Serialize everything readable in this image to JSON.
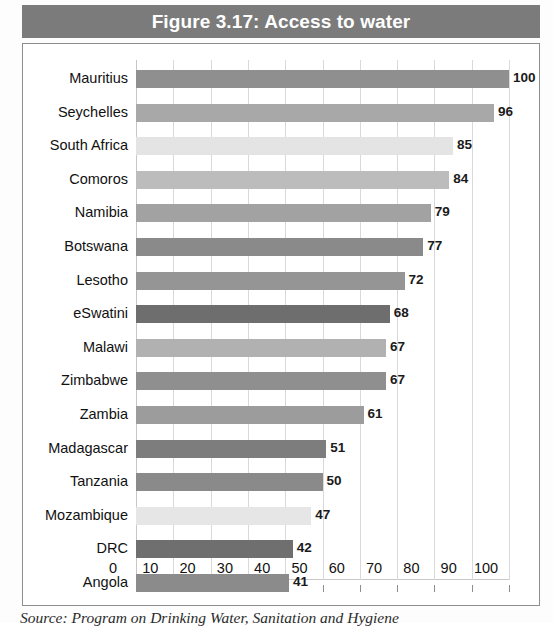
{
  "figure": {
    "title": "Figure 3.17: Access to water",
    "source": "Source: Program on Drinking Water, Sanitation and Hygiene",
    "title_bar_color": "#7b7b7b",
    "frame_color": "#8d8d8d",
    "grid_color": "#d9d9d9"
  },
  "chart_data": {
    "type": "bar",
    "orientation": "horizontal",
    "title": "Figure 3.17: Access to water",
    "xlabel": "",
    "ylabel": "",
    "xlim": [
      0,
      100
    ],
    "grid": true,
    "legend": "none",
    "xticks": [
      0,
      10,
      20,
      30,
      40,
      50,
      60,
      70,
      80,
      90,
      100
    ],
    "categories": [
      "Mauritius",
      "Seychelles",
      "South Africa",
      "Comoros",
      "Namibia",
      "Botswana",
      "Lesotho",
      "eSwatini",
      "Malawi",
      "Zimbabwe",
      "Zambia",
      "Madagascar",
      "Tanzania",
      "Mozambique",
      "DRC",
      "Angola"
    ],
    "values": [
      100,
      96,
      85,
      84,
      79,
      77,
      72,
      68,
      67,
      67,
      61,
      51,
      50,
      47,
      42,
      41
    ],
    "bar_colors": [
      "#8f8f8f",
      "#a8a8a8",
      "#e4e4e4",
      "#bcbcbc",
      "#a2a2a2",
      "#8a8a8a",
      "#959595",
      "#6e6e6e",
      "#b1b1b1",
      "#8f8f8f",
      "#9c9c9c",
      "#7d7d7d",
      "#8a8a8a",
      "#e6e6e6",
      "#6f6f6f",
      "#8b8b8b"
    ]
  }
}
